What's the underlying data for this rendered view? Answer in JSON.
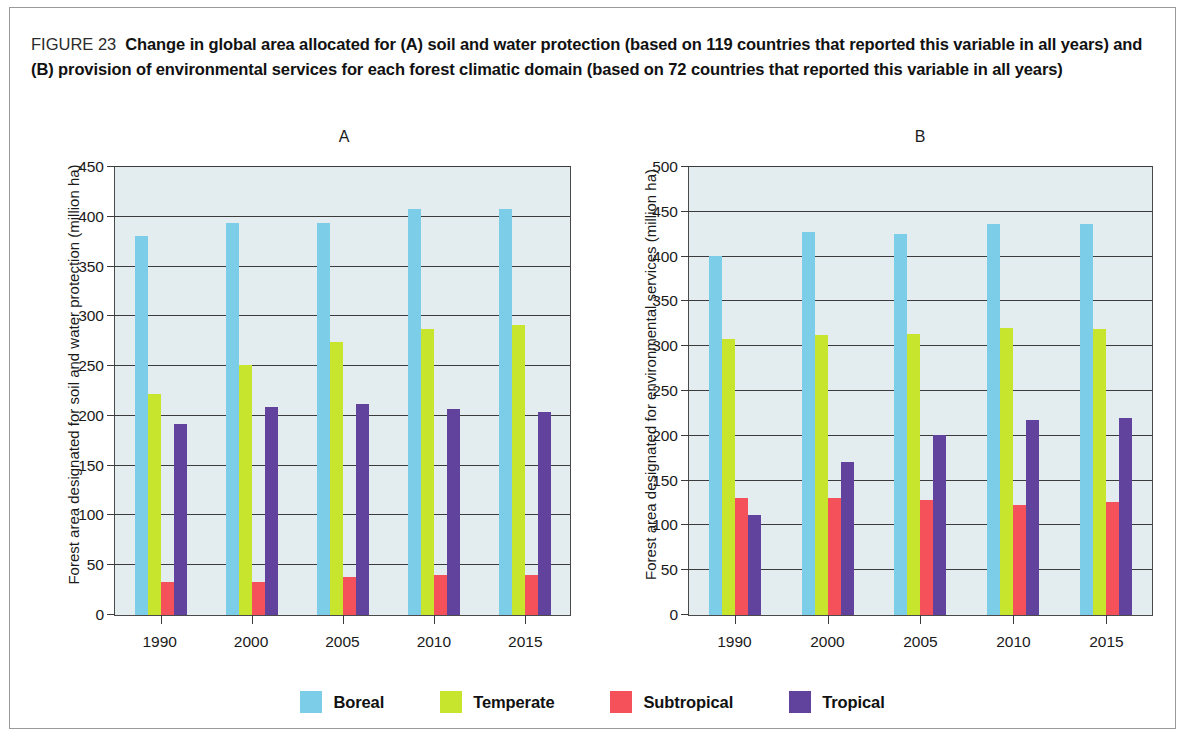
{
  "figure": {
    "number": "FIGURE 23",
    "caption": "Change in global area allocated for (A) soil and water protection (based on 119 countries that reported this variable in all years) and (B) provision of environmental services for each forest climatic domain (based on 72 countries that reported this variable in all years)"
  },
  "legend": {
    "items": [
      {
        "label": "Boreal",
        "color": "#7ccde8"
      },
      {
        "label": "Temperate",
        "color": "#c7e52c"
      },
      {
        "label": "Subtropical",
        "color": "#f4515b"
      },
      {
        "label": "Tropical",
        "color": "#61429c"
      }
    ]
  },
  "panels": {
    "a": {
      "label": "A",
      "ylabel": "Forest area designated for soil and water protection (million ha)",
      "yticks": [
        "0",
        "50",
        "100",
        "150",
        "200",
        "250",
        "300",
        "350",
        "400",
        "450"
      ],
      "xticks": [
        "1990",
        "2000",
        "2005",
        "2010",
        "2015"
      ]
    },
    "b": {
      "label": "B",
      "ylabel": "Forest area designated for environmental services (million ha)",
      "yticks": [
        "0",
        "50",
        "100",
        "150",
        "200",
        "250",
        "300",
        "350",
        "400",
        "450",
        "500"
      ],
      "xticks": [
        "1990",
        "2000",
        "2005",
        "2010",
        "2015"
      ]
    }
  },
  "chart_data": [
    {
      "id": "A",
      "type": "bar",
      "title": "A",
      "xlabel": "",
      "ylabel": "Forest area designated for soil and water protection (million ha)",
      "ylim": [
        0,
        450
      ],
      "ytick_step": 50,
      "grid": true,
      "legend_position": "bottom",
      "categories": [
        "1990",
        "2000",
        "2005",
        "2010",
        "2015"
      ],
      "series": [
        {
          "name": "Boreal",
          "color": "#7ccde8",
          "values": [
            381,
            394,
            394,
            408,
            408
          ]
        },
        {
          "name": "Temperate",
          "color": "#c7e52c",
          "values": [
            222,
            251,
            274,
            287,
            291
          ]
        },
        {
          "name": "Subtropical",
          "color": "#f4515b",
          "values": [
            33,
            33,
            38,
            40,
            40
          ]
        },
        {
          "name": "Tropical",
          "color": "#61429c",
          "values": [
            192,
            209,
            212,
            207,
            204
          ]
        }
      ]
    },
    {
      "id": "B",
      "type": "bar",
      "title": "B",
      "xlabel": "",
      "ylabel": "Forest area designated for environmental services (million ha)",
      "ylim": [
        0,
        500
      ],
      "ytick_step": 50,
      "grid": true,
      "legend_position": "bottom",
      "categories": [
        "1990",
        "2000",
        "2005",
        "2010",
        "2015"
      ],
      "series": [
        {
          "name": "Boreal",
          "color": "#7ccde8",
          "values": [
            401,
            428,
            425,
            436,
            436
          ]
        },
        {
          "name": "Temperate",
          "color": "#c7e52c",
          "values": [
            308,
            312,
            314,
            320,
            319
          ]
        },
        {
          "name": "Subtropical",
          "color": "#f4515b",
          "values": [
            131,
            131,
            128,
            123,
            126
          ]
        },
        {
          "name": "Tropical",
          "color": "#61429c",
          "values": [
            112,
            171,
            201,
            218,
            220
          ]
        }
      ]
    }
  ]
}
